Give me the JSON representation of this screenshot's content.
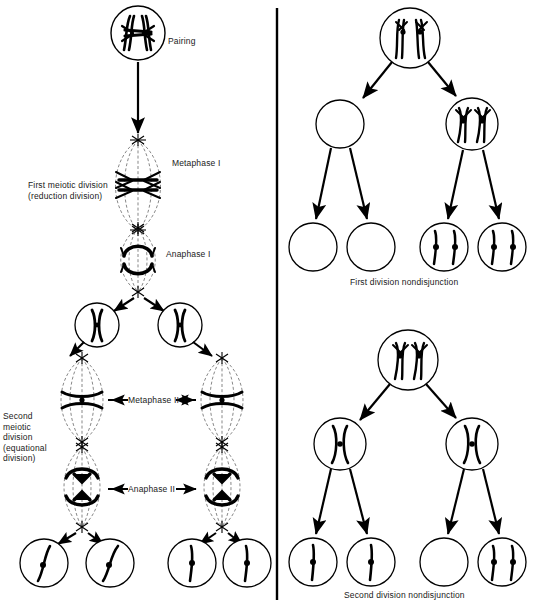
{
  "figure": {
    "divider": {
      "name": "vertical-divider",
      "x": 277,
      "color": "#000000"
    }
  },
  "left_panel": {
    "name": "normal-meiosis-panel",
    "labels": {
      "pairing": "Pairing",
      "metaphase_i": "Metaphase I",
      "anaphase_i": "Anaphase I",
      "first_division": "First meiotic division\n(reduction division)",
      "second_division": "Second\nmeiotic\ndivision\n(equational\ndivision)",
      "metaphase_ii": "Metaphase II",
      "anaphase_ii": "Anaphase II"
    },
    "stages": [
      {
        "id": "pairing",
        "type": "cell-circle",
        "cx": 138,
        "cy": 33,
        "r": 27,
        "content": "paired-homologous-chromosomes"
      },
      {
        "id": "metaphase-i",
        "type": "spindle",
        "cx": 138,
        "cy": 185,
        "rx": 25,
        "ry": 45,
        "content": "chromosomes-at-equator"
      },
      {
        "id": "anaphase-i",
        "type": "spindle",
        "cx": 138,
        "cy": 258,
        "rx": 22,
        "ry": 35,
        "content": "chromosomes-separating"
      },
      {
        "id": "daughter-left",
        "type": "cell-circle",
        "cx": 97,
        "cy": 325,
        "r": 22,
        "content": "single-chromosome-pair"
      },
      {
        "id": "daughter-right",
        "type": "cell-circle",
        "cx": 180,
        "cy": 325,
        "r": 22,
        "content": "single-chromosome-pair"
      },
      {
        "id": "metaphase-ii-left",
        "type": "spindle",
        "cx": 82,
        "cy": 399,
        "rx": 26,
        "ry": 44,
        "content": "chromosome-at-equator"
      },
      {
        "id": "metaphase-ii-right",
        "type": "spindle",
        "cx": 222,
        "cy": 399,
        "rx": 26,
        "ry": 44,
        "content": "chromosome-at-equator"
      },
      {
        "id": "anaphase-ii-left",
        "type": "spindle",
        "cx": 82,
        "cy": 487,
        "rx": 24,
        "ry": 42,
        "content": "chromatids-separating"
      },
      {
        "id": "anaphase-ii-right",
        "type": "spindle",
        "cx": 222,
        "cy": 487,
        "rx": 24,
        "ry": 42,
        "content": "chromatids-separating"
      },
      {
        "id": "gamete-1",
        "type": "cell-circle",
        "cx": 44,
        "cy": 563,
        "r": 24,
        "content": "one-chromatid"
      },
      {
        "id": "gamete-2",
        "type": "cell-circle",
        "cx": 110,
        "cy": 563,
        "r": 24,
        "content": "one-chromatid"
      },
      {
        "id": "gamete-3",
        "type": "cell-circle",
        "cx": 192,
        "cy": 563,
        "r": 24,
        "content": "one-chromatid"
      },
      {
        "id": "gamete-4",
        "type": "cell-circle",
        "cx": 247,
        "cy": 563,
        "r": 24,
        "content": "one-chromatid"
      }
    ]
  },
  "right_top_panel": {
    "name": "first-division-nondisjunction-panel",
    "caption": "First division nondisjunction",
    "cells": [
      {
        "id": "parent",
        "cx": 410,
        "cy": 38,
        "r": 30,
        "content": "four-chromatids",
        "chromatids": 4
      },
      {
        "id": "secondary-left",
        "cx": 340,
        "cy": 124,
        "r": 24,
        "content": "empty",
        "chromatids": 0
      },
      {
        "id": "secondary-right",
        "cx": 472,
        "cy": 124,
        "r": 26,
        "content": "four-chromatids",
        "chromatids": 4
      },
      {
        "id": "gamete-1",
        "cx": 313,
        "cy": 247,
        "r": 24,
        "content": "empty",
        "chromatids": 0
      },
      {
        "id": "gamete-2",
        "cx": 371,
        "cy": 247,
        "r": 24,
        "content": "empty",
        "chromatids": 0
      },
      {
        "id": "gamete-3",
        "cx": 444,
        "cy": 247,
        "r": 24,
        "content": "two-chromosomes",
        "chromatids": 2
      },
      {
        "id": "gamete-4",
        "cx": 502,
        "cy": 247,
        "r": 24,
        "content": "two-chromosomes",
        "chromatids": 2
      }
    ]
  },
  "right_bottom_panel": {
    "name": "second-division-nondisjunction-panel",
    "caption": "Second division nondisjunction",
    "cells": [
      {
        "id": "parent",
        "cx": 408,
        "cy": 360,
        "r": 30,
        "content": "four-chromatids",
        "chromatids": 4
      },
      {
        "id": "secondary-left",
        "cx": 340,
        "cy": 444,
        "r": 26,
        "content": "one-chromosome-pair",
        "chromatids": 2
      },
      {
        "id": "secondary-right",
        "cx": 472,
        "cy": 444,
        "r": 26,
        "content": "one-chromosome-pair",
        "chromatids": 2
      },
      {
        "id": "gamete-1",
        "cx": 313,
        "cy": 562,
        "r": 24,
        "content": "one-chromatid",
        "chromatids": 1
      },
      {
        "id": "gamete-2",
        "cx": 371,
        "cy": 562,
        "r": 24,
        "content": "one-chromatid",
        "chromatids": 1
      },
      {
        "id": "gamete-3",
        "cx": 444,
        "cy": 562,
        "r": 24,
        "content": "empty",
        "chromatids": 0
      },
      {
        "id": "gamete-4",
        "cx": 502,
        "cy": 562,
        "r": 24,
        "content": "two-chromatids",
        "chromatids": 2
      }
    ]
  }
}
